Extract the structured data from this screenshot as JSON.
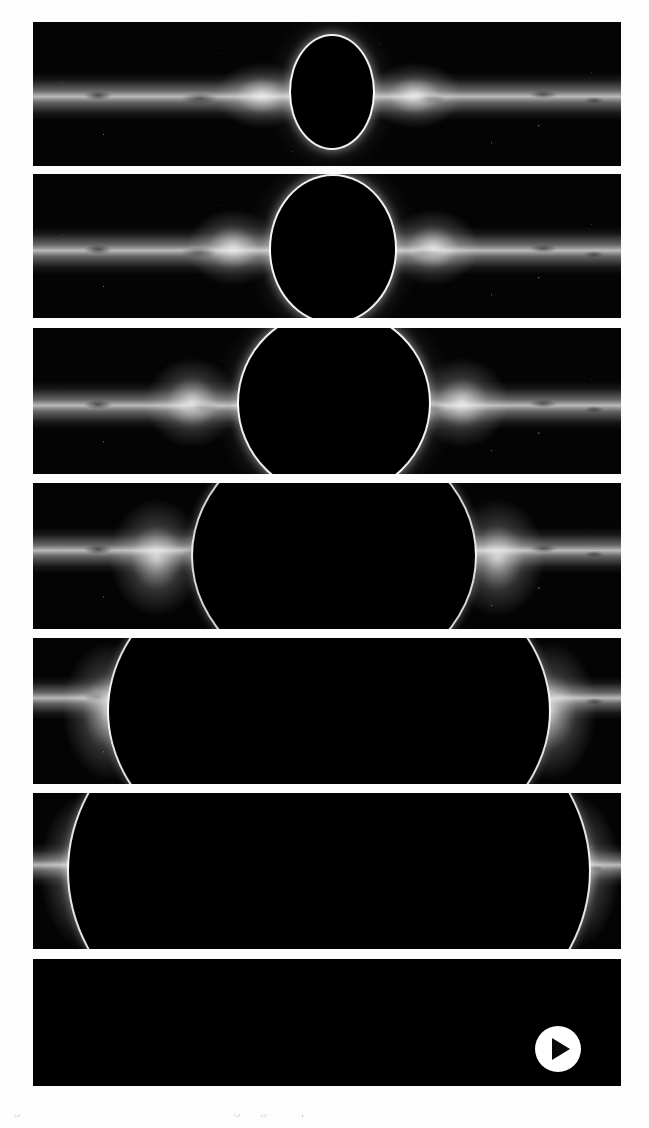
{
  "figure": {
    "panel_count": 7,
    "background_color": "#040404",
    "page_background": "#fdfdfd",
    "ring_color": "#ffffff",
    "shadow_color": "#000000",
    "frames": [
      {
        "index": 1,
        "label": "frame-1",
        "caption": "",
        "hole_diameter_pct": 26,
        "hole_center_x_pct": 51,
        "band_center_y_pct": 56,
        "band_thickness_pct": 46,
        "state": "distant"
      },
      {
        "index": 2,
        "label": "frame-2",
        "caption": "",
        "hole_diameter_pct": 38,
        "hole_center_x_pct": 51,
        "band_center_y_pct": 57,
        "band_thickness_pct": 46,
        "state": "approaching"
      },
      {
        "index": 3,
        "label": "frame-3",
        "caption": "",
        "hole_diameter_pct": 52,
        "hole_center_x_pct": 51,
        "band_center_y_pct": 57,
        "band_thickness_pct": 48,
        "state": "approaching"
      },
      {
        "index": 4,
        "label": "frame-4",
        "caption": "",
        "hole_diameter_pct": 74,
        "hole_center_x_pct": 51,
        "band_center_y_pct": 52,
        "band_thickness_pct": 44,
        "state": "near"
      },
      {
        "index": 5,
        "label": "frame-5",
        "caption": "",
        "hole_diameter_pct": 108,
        "hole_center_x_pct": 51,
        "band_center_y_pct": 47,
        "band_thickness_pct": 40,
        "state": "very-near"
      },
      {
        "index": 6,
        "label": "frame-6",
        "caption": "",
        "hole_diameter_pct": 130,
        "hole_center_x_pct": 51,
        "band_center_y_pct": 50,
        "band_thickness_pct": 38,
        "state": "very-near"
      },
      {
        "index": 7,
        "label": "frame-7",
        "caption": "",
        "hole_diameter_pct": 176,
        "hole_center_x_pct": 51,
        "band_center_y_pct": 56,
        "band_thickness_pct": 34,
        "state": "engulfing"
      }
    ]
  },
  "player": {
    "control_label": "Play",
    "icon": "play-triangle-icon",
    "button_color": "#ffffff",
    "icon_color": "#0b0b0b",
    "state": "paused"
  },
  "caption": {
    "cutoff_text": "Fig. 1 — simulated view of a black hole crossing the galactic plane"
  }
}
